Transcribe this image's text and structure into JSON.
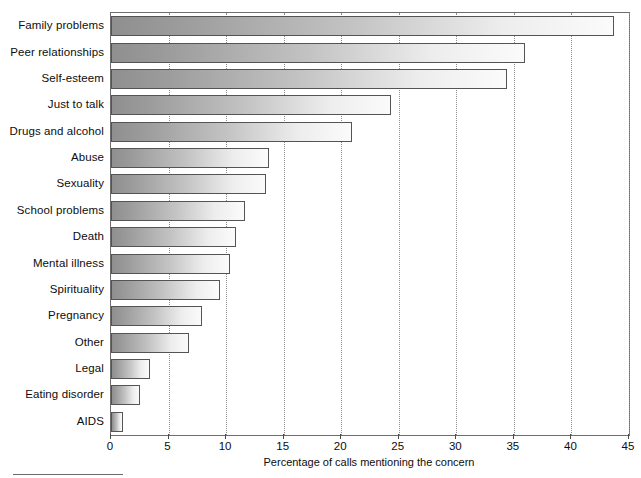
{
  "chart_data": {
    "type": "bar",
    "orientation": "horizontal",
    "title": "",
    "subtitle": "",
    "xlabel": "Percentage of calls mentioning the concern",
    "ylabel": "",
    "xlim": [
      0,
      45
    ],
    "ylim": null,
    "xticks": [
      0,
      5,
      10,
      15,
      20,
      25,
      30,
      35,
      40,
      45
    ],
    "xticklabels": [
      "0",
      "5",
      "10",
      "15",
      "20",
      "25",
      "30",
      "35",
      "40",
      "45"
    ],
    "grid": "vertical-dotted",
    "legend": null,
    "legend_position": "none",
    "categories": [
      "Family problems",
      "Peer relationships",
      "Self-esteem",
      "Just to talk",
      "Drugs and alcohol",
      "Abuse",
      "Sexuality",
      "School problems",
      "Death",
      "Mental illness",
      "Spirituality",
      "Pregnancy",
      "Other",
      "Legal",
      "Eating disorder",
      "AIDS"
    ],
    "values": [
      43.7,
      36.0,
      34.4,
      24.3,
      20.9,
      13.7,
      13.5,
      11.6,
      10.9,
      10.3,
      9.5,
      7.9,
      6.8,
      3.4,
      2.5,
      1.0
    ],
    "annotations": []
  },
  "style": {
    "bar_fill_dark": "#8f8f8f",
    "bar_fill_light": "#fbfbfb",
    "bar_border": "#545454",
    "frame_color": "#6e6e6e",
    "grid_color": "#8d8d8d",
    "text_color": "#0d0d0d",
    "background": "#ffffff"
  },
  "footnote": {
    "rule": true
  }
}
